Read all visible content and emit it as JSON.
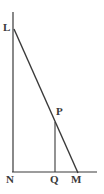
{
  "figure": {
    "kind": "geometry-diagram",
    "background_color": "#ffffff",
    "stroke_color": "#3a3a3a",
    "label_color": "#3a3a3a",
    "canvas": {
      "width": 104,
      "height": 194
    },
    "labels": {
      "L": "L",
      "P": "P",
      "N": "N",
      "Q": "Q",
      "M": "M"
    },
    "points": {
      "L": {
        "x": 14,
        "y": 29
      },
      "N": {
        "x": 13,
        "y": 172
      },
      "M": {
        "x": 78,
        "y": 172
      },
      "P": {
        "x": 55,
        "y": 122
      },
      "Q": {
        "x": 55,
        "y": 172
      }
    },
    "segments": [
      {
        "name": "vertical-line-LN",
        "x1": 13,
        "y1": 12,
        "x2": 13,
        "y2": 172
      },
      {
        "name": "hypotenuse-LM",
        "x1": 14,
        "y1": 29,
        "x2": 78,
        "y2": 173
      },
      {
        "name": "baseline-NM",
        "x1": 12,
        "y1": 172,
        "x2": 97,
        "y2": 172
      },
      {
        "name": "perpendicular-PQ",
        "x1": 55,
        "y1": 122,
        "x2": 55,
        "y2": 172
      }
    ]
  }
}
